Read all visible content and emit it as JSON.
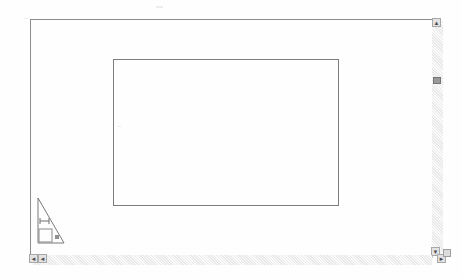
{
  "document": {
    "title": "Drawing Sheet",
    "background_color": "#fefefe",
    "line_color": "#7d7d7d"
  },
  "sheet": {
    "frame_label": "sheet-border",
    "inner_rect_label": "drawing-rectangle"
  },
  "symbol": {
    "name": "right-triangle-title-symbol",
    "upper_mark": "H",
    "lower_mark": "A"
  },
  "scrollbars": {
    "vertical": {
      "up_arrow": "▲",
      "down_arrow": "▼"
    },
    "horizontal": {
      "left_arrow": "◄",
      "left_page_arrow": "◄",
      "right_arrow": "►"
    }
  }
}
